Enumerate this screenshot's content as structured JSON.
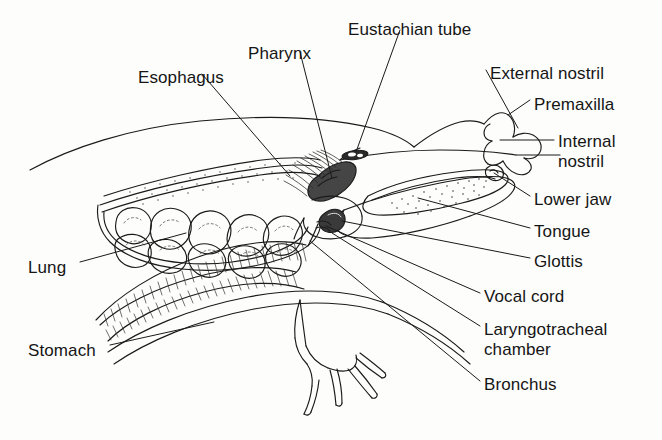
{
  "figure": {
    "background_color": "#fdfdfc",
    "ink_color": "#1a1a1a",
    "labels": [
      {
        "id": "esophagus",
        "text": "Esophagus",
        "x": 138,
        "y": 68,
        "align": "left"
      },
      {
        "id": "pharynx",
        "text": "Pharynx",
        "x": 248,
        "y": 44,
        "align": "left"
      },
      {
        "id": "eustachian-tube",
        "text": "Eustachian tube",
        "x": 348,
        "y": 20,
        "align": "left"
      },
      {
        "id": "external-nostril",
        "text": "External nostril",
        "x": 490,
        "y": 64,
        "align": "left"
      },
      {
        "id": "premaxilla",
        "text": "Premaxilla",
        "x": 534,
        "y": 95,
        "align": "left"
      },
      {
        "id": "internal-nostril",
        "text": "Internal\nnostril",
        "x": 558,
        "y": 132,
        "align": "left"
      },
      {
        "id": "lower-jaw",
        "text": "Lower jaw",
        "x": 534,
        "y": 190,
        "align": "left"
      },
      {
        "id": "tongue",
        "text": "Tongue",
        "x": 534,
        "y": 222,
        "align": "left"
      },
      {
        "id": "glottis",
        "text": "Glottis",
        "x": 534,
        "y": 252,
        "align": "left"
      },
      {
        "id": "vocal-cord",
        "text": "Vocal cord",
        "x": 484,
        "y": 287,
        "align": "left"
      },
      {
        "id": "laryngotracheal",
        "text": "Laryngotracheal\nchamber",
        "x": 484,
        "y": 320,
        "align": "left"
      },
      {
        "id": "bronchus",
        "text": "Bronchus",
        "x": 484,
        "y": 375,
        "align": "left"
      },
      {
        "id": "lung",
        "text": "Lung",
        "x": 28,
        "y": 258,
        "align": "left"
      },
      {
        "id": "stomach",
        "text": "Stomach",
        "x": 28,
        "y": 341,
        "align": "left"
      }
    ]
  }
}
